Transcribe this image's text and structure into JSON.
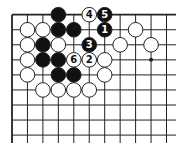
{
  "diagram": {
    "type": "go-board-corner",
    "grid": {
      "origin_x": 12,
      "origin_y": 14.7,
      "col_spacing": 15.45,
      "row_spacing": 15.05,
      "cols": 11,
      "rows": 9,
      "line_extend_right": 176,
      "line_extend_bottom": 143,
      "line_color": "#222222",
      "edge_top": true,
      "edge_left": true
    },
    "hoshi": [
      {
        "c": 9,
        "r": 3
      }
    ],
    "colors": {
      "black": "#111111",
      "white": "#ffffff",
      "stone_outline": "#222222",
      "label_on_black": "#ffffff",
      "label_on_white": "#111111"
    },
    "stones": [
      {
        "c": 3,
        "r": 0,
        "color": "black",
        "label": ""
      },
      {
        "c": 5,
        "r": 0,
        "color": "white",
        "label": "4"
      },
      {
        "c": 6,
        "r": 0,
        "color": "black",
        "label": "5"
      },
      {
        "c": 1,
        "r": 1,
        "color": "white",
        "label": ""
      },
      {
        "c": 2,
        "r": 1,
        "color": "white",
        "label": ""
      },
      {
        "c": 3,
        "r": 1,
        "color": "black",
        "label": ""
      },
      {
        "c": 4,
        "r": 1,
        "color": "black",
        "label": ""
      },
      {
        "c": 6,
        "r": 1,
        "color": "black",
        "label": "1"
      },
      {
        "c": 8,
        "r": 1,
        "color": "white",
        "label": ""
      },
      {
        "c": 1,
        "r": 2,
        "color": "white",
        "label": ""
      },
      {
        "c": 2,
        "r": 2,
        "color": "black",
        "label": ""
      },
      {
        "c": 3,
        "r": 2,
        "color": "white",
        "label": ""
      },
      {
        "c": 5,
        "r": 2,
        "color": "black",
        "label": "3"
      },
      {
        "c": 7,
        "r": 2,
        "color": "white",
        "label": ""
      },
      {
        "c": 9,
        "r": 2,
        "color": "white",
        "label": ""
      },
      {
        "c": 1,
        "r": 3,
        "color": "white",
        "label": ""
      },
      {
        "c": 2,
        "r": 3,
        "color": "black",
        "label": ""
      },
      {
        "c": 3,
        "r": 3,
        "color": "black",
        "label": ""
      },
      {
        "c": 4,
        "r": 3,
        "color": "white",
        "label": "6"
      },
      {
        "c": 5,
        "r": 3,
        "color": "white",
        "label": "2"
      },
      {
        "c": 6,
        "r": 3,
        "color": "white",
        "label": ""
      },
      {
        "c": 1,
        "r": 4,
        "color": "white",
        "label": ""
      },
      {
        "c": 3,
        "r": 4,
        "color": "black",
        "label": ""
      },
      {
        "c": 4,
        "r": 4,
        "color": "black",
        "label": ""
      },
      {
        "c": 6,
        "r": 4,
        "color": "white",
        "label": ""
      },
      {
        "c": 2,
        "r": 5,
        "color": "white",
        "label": ""
      },
      {
        "c": 3,
        "r": 5,
        "color": "white",
        "label": ""
      },
      {
        "c": 4,
        "r": 5,
        "color": "white",
        "label": ""
      },
      {
        "c": 5,
        "r": 5,
        "color": "white",
        "label": ""
      }
    ]
  }
}
